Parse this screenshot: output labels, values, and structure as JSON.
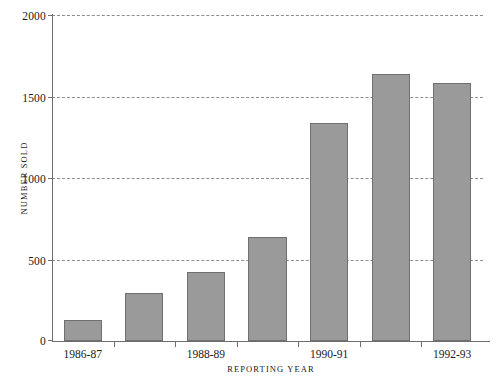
{
  "chart_data": {
    "type": "bar",
    "title": "",
    "xlabel": "REPORTING YEAR",
    "ylabel": "NUMBER SOLD",
    "categories": [
      "1986-87",
      "1987-88",
      "1988-89",
      "1989-90",
      "1990-91",
      "1991-92",
      "1992-93"
    ],
    "visible_category_labels": [
      "1986-87",
      "1988-89",
      "1990-91",
      "1992-93"
    ],
    "values": [
      130,
      295,
      425,
      640,
      1340,
      1640,
      1580
    ],
    "ylim": [
      0,
      2000
    ],
    "yticks": [
      0,
      500,
      1000,
      1500,
      2000
    ],
    "ytick_labels": [
      "0",
      "500",
      "1000",
      "1500",
      "2000"
    ],
    "grid": true,
    "grid_style": "dashed-horizontal",
    "legend": "none",
    "bar_color": "#9a9a9a",
    "bar_border_color": "#707070",
    "axis_color": "#6d6d6d",
    "gridline_color": "#8d8d8d"
  },
  "axes": {
    "y_title": "NUMBER SOLD",
    "x_title": "REPORTING YEAR"
  },
  "y_ticks": [
    {
      "label": "2000",
      "value": 2000
    },
    {
      "label": "1500",
      "value": 1500
    },
    {
      "label": "1000",
      "value": 1000
    },
    {
      "label": "500",
      "value": 500
    },
    {
      "label": "0",
      "value": 0
    }
  ],
  "x_ticks": [
    {
      "label": "1986-87",
      "index": 0
    },
    {
      "label": "1988-89",
      "index": 2
    },
    {
      "label": "1990-91",
      "index": 4
    },
    {
      "label": "1992-93",
      "index": 6
    }
  ],
  "bars": [
    {
      "category": "1986-87",
      "value": 130
    },
    {
      "category": "1987-88",
      "value": 295
    },
    {
      "category": "1988-89",
      "value": 425
    },
    {
      "category": "1989-90",
      "value": 640
    },
    {
      "category": "1990-91",
      "value": 1340
    },
    {
      "category": "1991-92",
      "value": 1640
    },
    {
      "category": "1992-93",
      "value": 1580
    }
  ],
  "footnote": ""
}
